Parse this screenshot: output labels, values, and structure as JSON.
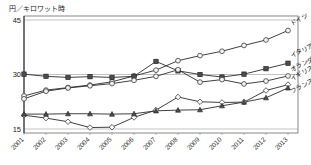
{
  "chart": {
    "unit_label": "円／キロワット時",
    "ylabel": "",
    "xlabel": ""
  },
  "axis": {
    "yticks": [
      "45",
      "30",
      "15"
    ],
    "xticks": [
      "2001",
      "2001",
      "2002",
      "2003",
      "2004",
      "2005",
      "2006",
      "2007",
      "2008",
      "2009",
      "2010",
      "2011",
      "2012",
      "2013"
    ]
  },
  "labels": {
    "germany": "ドイツ",
    "italy": "イタリア",
    "netherlands": "オランダ",
    "uk": "イギリス",
    "france": "フランス"
  },
  "chart_data": {
    "type": "line",
    "title": "",
    "xlabel": "",
    "ylabel": "円／キロワット時",
    "ylim": [
      15,
      45
    ],
    "grid": true,
    "legend_position": "right-inline",
    "categories": [
      "2001",
      "2002",
      "2003",
      "2004",
      "2005",
      "2006",
      "2007",
      "2008",
      "2009",
      "2010",
      "2011",
      "2012",
      "2013"
    ],
    "series": [
      {
        "name": "ドイツ",
        "marker": "open-circle",
        "values": [
          24.1,
          25.7,
          26.4,
          27.1,
          28.0,
          29.6,
          31.2,
          33.8,
          35.2,
          36.4,
          38.0,
          39.5,
          42.1
        ]
      },
      {
        "name": "イタリア",
        "marker": "filled-square",
        "values": [
          30.1,
          29.5,
          29.2,
          29.4,
          29.2,
          29.5,
          33.6,
          31.0,
          30.0,
          29.3,
          30.1,
          31.6,
          33.1
        ]
      },
      {
        "name": "オランダ",
        "marker": "open-circle",
        "values": [
          23.3,
          25.4,
          26.3,
          26.9,
          27.5,
          28.4,
          29.5,
          31.3,
          27.9,
          28.6,
          27.4,
          28.2,
          29.6
        ]
      },
      {
        "name": "イギリス",
        "marker": "open-diamond",
        "values": [
          18.8,
          18.0,
          17.0,
          15.4,
          15.5,
          18.2,
          20.2,
          23.8,
          22.5,
          22.3,
          22.4,
          25.6,
          27.2
        ]
      },
      {
        "name": "フランス",
        "marker": "filled-triangle",
        "values": [
          19.1,
          19.1,
          19.2,
          19.2,
          19.1,
          19.2,
          20.0,
          20.2,
          20.3,
          21.4,
          22.4,
          23.6,
          26.3
        ]
      }
    ]
  }
}
